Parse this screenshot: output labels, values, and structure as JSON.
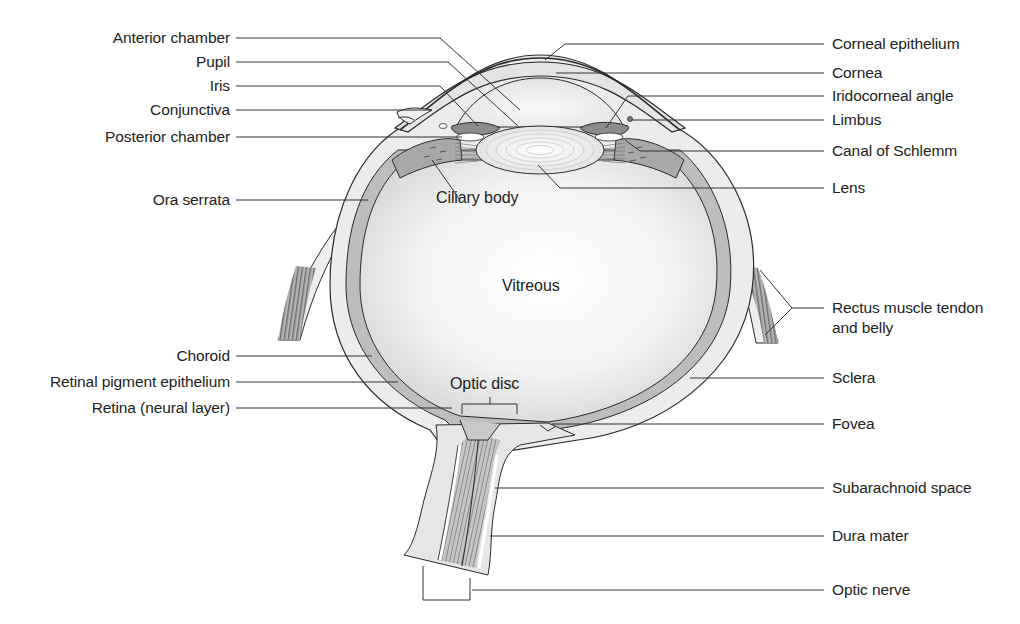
{
  "diagram": {
    "left_labels": [
      {
        "text": "Anterior chamber",
        "y": 38
      },
      {
        "text": "Pupil",
        "y": 62
      },
      {
        "text": "Iris",
        "y": 86
      },
      {
        "text": "Conjunctiva",
        "y": 110
      },
      {
        "text": "Posterior chamber",
        "y": 137
      },
      {
        "text": "Ora serrata",
        "y": 200
      },
      {
        "text": "Choroid",
        "y": 356
      },
      {
        "text": "Retinal pigment epithelium",
        "y": 382
      },
      {
        "text": "Retina (neural layer)",
        "y": 408
      }
    ],
    "right_labels": [
      {
        "text": "Corneal epithelium",
        "y": 44
      },
      {
        "text": "Cornea",
        "y": 73
      },
      {
        "text": "Iridocorneal angle",
        "y": 96
      },
      {
        "text": "Limbus",
        "y": 120
      },
      {
        "text": "Canal of Schlemm",
        "y": 151
      },
      {
        "text": "Lens",
        "y": 188
      },
      {
        "text": "Rectus muscle tendon",
        "y": 308
      },
      {
        "text": "and belly",
        "y": 328
      },
      {
        "text": "Sclera",
        "y": 378
      },
      {
        "text": "Fovea",
        "y": 424
      },
      {
        "text": "Subarachnoid space",
        "y": 488
      },
      {
        "text": "Dura mater",
        "y": 536
      },
      {
        "text": "Optic nerve",
        "y": 590
      }
    ],
    "inner_labels": {
      "ciliary_body": "Ciliary body",
      "vitreous": "Vitreous",
      "optic_disc": "Optic disc"
    },
    "colors": {
      "outline": "#2a2a2a",
      "sclera_fill": "#ededed",
      "choroid_fill": "#bdbdbd",
      "vitreous_center": "#ffffff",
      "vitreous_edge": "#d8d8d8",
      "iris_fill": "#8c8c8c",
      "muscle_fill": "#9a9a9a"
    }
  }
}
